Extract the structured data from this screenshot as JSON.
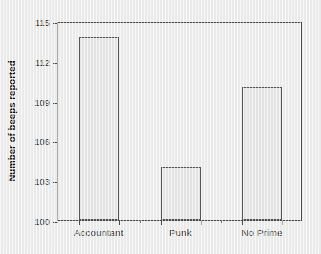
{
  "chart_data": {
    "type": "bar",
    "title": "",
    "subtitle": "",
    "categories": [
      "Accountant",
      "Punk",
      "No Prime"
    ],
    "values": [
      113.8,
      104.0,
      110.0
    ],
    "xlabel": "",
    "ylabel": "Number of beeps reported",
    "ylim": [
      100,
      115
    ],
    "ytick_labels": [
      "100",
      "103",
      "106",
      "109",
      "112",
      "115"
    ],
    "ytick_values": [
      100,
      103,
      106,
      109,
      112,
      115
    ],
    "grid": false,
    "legend": null,
    "legend_position": "none",
    "annotations": [],
    "colors": {
      "background": "#ededed",
      "bar_fill": "#e6e6e6",
      "bar_edge": "#555555",
      "axis": "#4a4a4a",
      "text": "#2a2a2a"
    }
  }
}
